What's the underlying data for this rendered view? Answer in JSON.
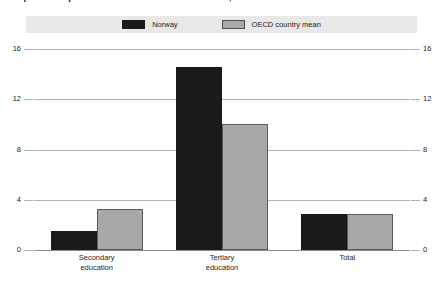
{
  "title": {
    "figure_number": "9.",
    "text": "Expenditure per student in education institutions, 1995"
  },
  "legend": {
    "items": [
      {
        "label": "Norway",
        "color": "#1a1a1a",
        "swatch": "dark-swatch"
      },
      {
        "label": "OECD country mean",
        "color": "#a8a8a8",
        "swatch": "light-swatch"
      }
    ]
  },
  "axis": {
    "ticks": [
      "16",
      "12",
      "8",
      "4",
      "0"
    ],
    "left_labels": [
      "16",
      "12",
      "8",
      "4",
      "0"
    ],
    "right_labels": [
      "16",
      "12",
      "8",
      "4",
      "0"
    ]
  },
  "chart_data": {
    "type": "bar",
    "title": "Expenditure per student in education institutions, 1995",
    "categories": [
      "Secondary\neducation",
      "Tertiary\neducation",
      "Total"
    ],
    "series": [
      {
        "name": "Norway",
        "color": "#1a1a1a",
        "values": [
          1.5,
          14.6,
          2.9
        ]
      },
      {
        "name": "OECD country mean",
        "color": "#a8a8a8",
        "values": [
          3.3,
          10.0,
          2.9
        ]
      }
    ],
    "xlabel": "",
    "ylabel": "",
    "ylim": [
      0,
      16
    ],
    "yticks": [
      0,
      4,
      8,
      12,
      16
    ],
    "grid": true,
    "legend_position": "top"
  }
}
